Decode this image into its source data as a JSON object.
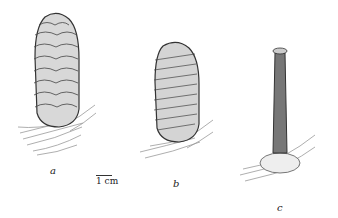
{
  "figure": {
    "panels": [
      {
        "id": "a",
        "label": "a",
        "subject": "mature cone, ovoid-cylindrical, imbricate scales, with needle cluster at base"
      },
      {
        "id": "b",
        "label": "b",
        "subject": "cone, oblong, bristly scale tips, with needle cluster at base"
      },
      {
        "id": "c",
        "label": "c",
        "subject": "cone axis (rachis) remaining after scale shedding, with basal scales and needles"
      }
    ],
    "scale_bar": {
      "label": "1 cm"
    }
  }
}
